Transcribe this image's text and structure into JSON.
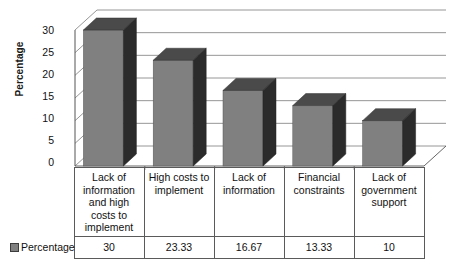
{
  "chart_data": {
    "type": "bar",
    "title": "",
    "xlabel": "",
    "ylabel": "Percentage",
    "categories": [
      "Lack of information and high costs to implement",
      "High costs to implement",
      "Lack of information",
      "Financial constraints",
      "Lack of government support"
    ],
    "values": [
      30,
      23.33,
      16.67,
      13.33,
      10
    ],
    "value_labels": [
      "30",
      "23.33",
      "16.67",
      "13.33",
      "10"
    ],
    "ylim": [
      0,
      30
    ],
    "yticks": [
      0,
      5,
      10,
      15,
      20,
      25,
      30
    ],
    "ytick_labels": [
      "0",
      "5",
      "10",
      "15",
      "20",
      "25",
      "30"
    ],
    "grid": true,
    "legend": [
      "Percentage"
    ],
    "legend_position": "bottom-left",
    "style": "3d-column",
    "colors": {
      "bar_front": "#808080",
      "bar_top": "#4a4a4a",
      "bar_side": "#2b2b2b",
      "gridline": "#8a8a8a",
      "axis": "#555555",
      "wall": "#ffffff",
      "table_border": "#5a5a5a",
      "text": "#111111"
    }
  },
  "legend_label": "Percentage",
  "table": {
    "series_label": "Percentage"
  }
}
